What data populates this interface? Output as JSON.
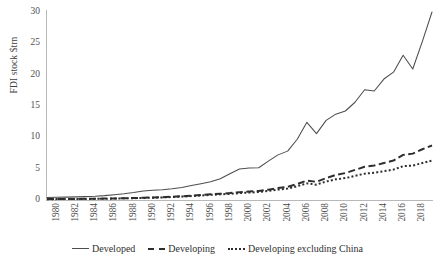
{
  "chart_data": {
    "type": "line",
    "title": "",
    "xlabel": "",
    "ylabel": "FDI stock $trn",
    "xlim": [
      1980,
      2020
    ],
    "ylim": [
      0,
      30
    ],
    "yticks": [
      0,
      5,
      10,
      15,
      20,
      25,
      30
    ],
    "xticks": [
      1980,
      1982,
      1984,
      1986,
      1988,
      1990,
      1992,
      1994,
      1996,
      1998,
      2000,
      2002,
      2004,
      2006,
      2008,
      2010,
      2012,
      2014,
      2016,
      2018,
      2020
    ],
    "grid": false,
    "legend_position": "bottom",
    "x": [
      1980,
      1981,
      1982,
      1983,
      1984,
      1985,
      1986,
      1987,
      1988,
      1989,
      1990,
      1991,
      1992,
      1993,
      1994,
      1995,
      1996,
      1997,
      1998,
      1999,
      2000,
      2001,
      2002,
      2003,
      2004,
      2005,
      2006,
      2007,
      2008,
      2009,
      2010,
      2011,
      2012,
      2013,
      2014,
      2015,
      2016,
      2017,
      2018,
      2019,
      2020
    ],
    "series": [
      {
        "name": "Developed",
        "style": "solid",
        "color": "#4d4d4d",
        "values": [
          0.4,
          0.43,
          0.46,
          0.5,
          0.54,
          0.6,
          0.7,
          0.85,
          1.0,
          1.2,
          1.45,
          1.55,
          1.65,
          1.8,
          2.0,
          2.3,
          2.6,
          2.9,
          3.4,
          4.2,
          4.95,
          5.1,
          5.15,
          6.2,
          7.2,
          7.8,
          9.7,
          12.4,
          10.6,
          12.7,
          13.7,
          14.2,
          15.6,
          17.6,
          17.4,
          19.3,
          20.4,
          23.1,
          20.9,
          25.3,
          30.0
        ]
      },
      {
        "name": "Developing",
        "style": "dashed",
        "color": "#2e2e2e",
        "values": [
          0.14,
          0.15,
          0.16,
          0.17,
          0.18,
          0.2,
          0.22,
          0.25,
          0.28,
          0.32,
          0.36,
          0.4,
          0.45,
          0.52,
          0.6,
          0.7,
          0.8,
          0.92,
          1.0,
          1.1,
          1.25,
          1.35,
          1.45,
          1.65,
          1.9,
          2.1,
          2.55,
          3.1,
          2.9,
          3.5,
          4.0,
          4.3,
          4.8,
          5.3,
          5.5,
          5.9,
          6.3,
          7.2,
          7.4,
          8.1,
          8.7
        ]
      },
      {
        "name": "Developing excluding China",
        "style": "dotted",
        "color": "#2e2e2e",
        "values": [
          0.13,
          0.14,
          0.15,
          0.16,
          0.17,
          0.18,
          0.2,
          0.23,
          0.26,
          0.29,
          0.33,
          0.36,
          0.41,
          0.47,
          0.54,
          0.63,
          0.72,
          0.82,
          0.9,
          0.98,
          1.1,
          1.18,
          1.28,
          1.45,
          1.66,
          1.82,
          2.2,
          2.65,
          2.45,
          2.95,
          3.3,
          3.5,
          3.85,
          4.2,
          4.35,
          4.6,
          4.85,
          5.4,
          5.5,
          5.9,
          6.3
        ]
      }
    ]
  },
  "legend": {
    "items": [
      {
        "label": "Developed",
        "style": "solid"
      },
      {
        "label": "Developing",
        "style": "dashed"
      },
      {
        "label": "Developing excluding China",
        "style": "dotted"
      }
    ]
  }
}
